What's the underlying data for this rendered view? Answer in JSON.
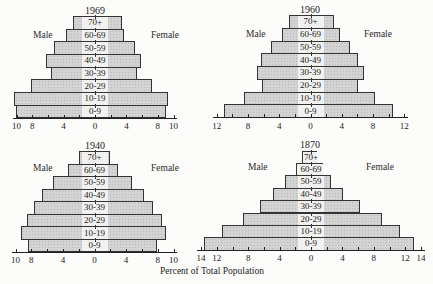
{
  "figure": {
    "xlabel": "Percent of Total Population"
  },
  "chart_data": [
    {
      "type": "bar",
      "subtype": "population-pyramid",
      "title": "1969",
      "left_label": "Male",
      "right_label": "Female",
      "categories": [
        "70+",
        "60-69",
        "50-59",
        "40-49",
        "30-39",
        "20-29",
        "10-19",
        "0-9"
      ],
      "series": [
        {
          "name": "Male",
          "values": [
            2.8,
            3.7,
            5.2,
            6.2,
            5.6,
            8.1,
            10.3,
            10.1
          ]
        },
        {
          "name": "Female",
          "values": [
            3.4,
            3.7,
            5.1,
            5.9,
            5.4,
            7.2,
            9.3,
            9.1
          ]
        }
      ],
      "xlim": [
        -10,
        10
      ],
      "xticks": [
        -10,
        -8,
        -4,
        0,
        4,
        8,
        10
      ],
      "xtick_labels": [
        "10",
        "8",
        "4",
        "0",
        "4",
        "8",
        "10"
      ],
      "xlabel": "Percent of Total Population",
      "grid": false
    },
    {
      "type": "bar",
      "subtype": "population-pyramid",
      "title": "1960",
      "left_label": "Male",
      "right_label": "Female",
      "categories": [
        "70+",
        "60-69",
        "50-59",
        "40-49",
        "30-39",
        "20-29",
        "10-19",
        "0-9"
      ],
      "series": [
        {
          "name": "Male",
          "values": [
            2.7,
            3.7,
            5.0,
            6.3,
            6.8,
            6.2,
            8.5,
            11.1
          ]
        },
        {
          "name": "Female",
          "values": [
            3.0,
            3.8,
            5.0,
            6.1,
            6.8,
            6.1,
            8.2,
            10.6
          ]
        }
      ],
      "xlim": [
        -12,
        12
      ],
      "xticks": [
        -12,
        -8,
        -4,
        0,
        4,
        8,
        12
      ],
      "xtick_labels": [
        "12",
        "8",
        "4",
        "0",
        "4",
        "8",
        "12"
      ],
      "xlabel": "Percent of Total Population",
      "grid": false
    },
    {
      "type": "bar",
      "subtype": "population-pyramid",
      "title": "1940",
      "left_label": "Male",
      "right_label": "Female",
      "categories": [
        "70+",
        "60-69",
        "50-59",
        "40-49",
        "30-39",
        "20-29",
        "10-19",
        "0-9"
      ],
      "series": [
        {
          "name": "Male",
          "values": [
            2.0,
            3.4,
            5.2,
            6.6,
            7.6,
            8.6,
            9.3,
            8.4
          ]
        },
        {
          "name": "Female",
          "values": [
            2.0,
            3.0,
            4.7,
            6.3,
            7.4,
            8.6,
            9.0,
            7.9
          ]
        }
      ],
      "xlim": [
        -10,
        10
      ],
      "xticks": [
        -10,
        -8,
        -4,
        0,
        4,
        8,
        10
      ],
      "xtick_labels": [
        "10",
        "8",
        "4",
        "0",
        "4",
        "8",
        "10"
      ],
      "xlabel": "Percent of Total Population",
      "grid": false
    },
    {
      "type": "bar",
      "subtype": "population-pyramid",
      "title": "1870",
      "left_label": "Male",
      "right_label": "Female",
      "categories": [
        "70+",
        "60-69",
        "50-59",
        "40-49",
        "30-39",
        "20-29",
        "10-19",
        "0-9"
      ],
      "series": [
        {
          "name": "Male",
          "values": [
            1.1,
            1.9,
            3.3,
            4.9,
            6.5,
            8.7,
            11.4,
            13.6
          ]
        },
        {
          "name": "Female",
          "values": [
            0.8,
            1.5,
            2.5,
            4.1,
            6.2,
            9.0,
            11.3,
            13.1
          ]
        }
      ],
      "xlim": [
        -14,
        14
      ],
      "xticks": [
        -14,
        -12,
        -8,
        -4,
        0,
        4,
        8,
        12,
        14
      ],
      "xtick_labels": [
        "14",
        "12",
        "8",
        "4",
        "0",
        "4",
        "8",
        "12",
        "14"
      ],
      "xlabel": "Percent of Total Population",
      "grid": false
    }
  ]
}
